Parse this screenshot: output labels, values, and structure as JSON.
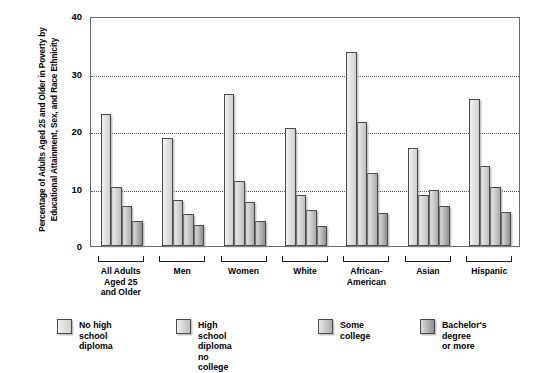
{
  "chart_data": {
    "type": "bar",
    "title": "",
    "xlabel": "",
    "ylabel": "Percentage of Adults Aged 25 and Older in Poverty by Educational Attainment, Sex, and Race Ethnicity",
    "ylim": [
      0,
      40
    ],
    "yticks": [
      0,
      10,
      20,
      30,
      40
    ],
    "ytick_labels": [
      "0",
      "10",
      "20",
      "30",
      "40"
    ],
    "grid": "horizontal-dotted",
    "legend_position": "bottom",
    "categories": [
      "All Adults\nAged 25\nand Older",
      "Men",
      "Women",
      "White",
      "African-\nAmerican",
      "Asian",
      "Hispanic"
    ],
    "series": [
      {
        "name": "No high school diploma",
        "values": [
          23.0,
          18.8,
          26.5,
          20.6,
          33.7,
          17.1,
          25.6
        ]
      },
      {
        "name": "High school diploma\nno college",
        "values": [
          10.3,
          8.0,
          11.3,
          8.8,
          21.6,
          8.8,
          14.0
        ]
      },
      {
        "name": "Some college",
        "values": [
          7.0,
          5.5,
          7.7,
          6.3,
          12.7,
          9.8,
          10.2
        ]
      },
      {
        "name": "Bachelor's degree\nor more",
        "values": [
          4.3,
          3.6,
          4.4,
          3.4,
          5.8,
          7.0,
          6.0
        ]
      }
    ]
  },
  "legend": {
    "items": [
      {
        "label": "No high school diploma",
        "swatch": "series-0-swatch"
      },
      {
        "label": "High school diploma\nno college",
        "swatch": "series-1-swatch"
      },
      {
        "label": "Some college",
        "swatch": "series-2-swatch"
      },
      {
        "label": "Bachelor's degree\nor more",
        "swatch": "series-3-swatch"
      }
    ]
  },
  "colors": {
    "series_0": "#e2e2e2",
    "series_1": "#d8d8d8",
    "series_2": "#cdcdcd",
    "series_3": "#bdbdbd",
    "axis": "#6b6b6b",
    "gridline": "#555555",
    "text": "#000000",
    "background": "#ffffff"
  }
}
